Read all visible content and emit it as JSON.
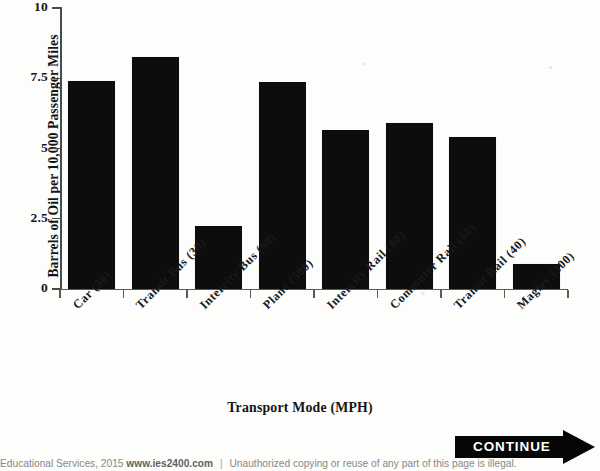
{
  "chart_data": {
    "type": "bar",
    "title": "",
    "xlabel": "Transport Mode (MPH)",
    "ylabel": "Barrels of Oil per 10,000 Passenger Miles",
    "categories": [
      "Car (30)",
      "Transit Bus (30)",
      "Intercity Bus (60)",
      "Plane (500)",
      "Intercity Rail (80)",
      "Commuter Rail (60)",
      "Transit Rail (40)",
      "Maglev (300)"
    ],
    "values": [
      7.4,
      8.25,
      2.25,
      7.35,
      5.65,
      5.9,
      5.4,
      0.9
    ],
    "ylim": [
      0,
      10
    ],
    "ytick_labels": [
      "0",
      "2.5",
      "5",
      "7.5",
      "10"
    ],
    "ytick_values": [
      0,
      2.5,
      5,
      7.5,
      10
    ],
    "grid": false,
    "legend": false,
    "bar_color": "#0d0d0d"
  },
  "continue_button": {
    "label": "CONTINUE"
  },
  "footer": {
    "publisher": "Educational Services, 2015",
    "website": "www.ies2400.com",
    "separator": "|",
    "notice": "Unauthorized copying or reuse of any part of this page is illegal."
  }
}
